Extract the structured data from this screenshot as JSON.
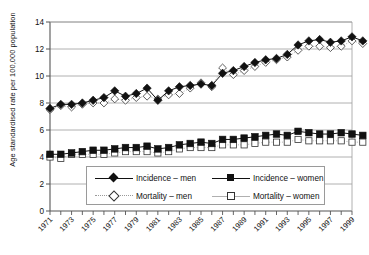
{
  "chart_data": {
    "type": "line",
    "title": "",
    "xlabel": "",
    "ylabel": "Age standardised rate per 100,000 population",
    "ylim": [
      0,
      14
    ],
    "ytick_values": [
      0,
      2,
      4,
      6,
      8,
      10,
      12,
      14
    ],
    "ytick_labels": [
      "0",
      "2",
      "4",
      "6",
      "8",
      "10",
      "12",
      "14"
    ],
    "grid": "horizontal",
    "legend_position": "bottom-center-inside",
    "x": [
      1971,
      1972,
      1973,
      1974,
      1975,
      1976,
      1977,
      1978,
      1979,
      1980,
      1981,
      1982,
      1983,
      1984,
      1985,
      1986,
      1987,
      1988,
      1989,
      1990,
      1991,
      1992,
      1993,
      1994,
      1995,
      1996,
      1997,
      1998,
      1999,
      2000
    ],
    "xtick_labels": [
      "1971",
      "1973",
      "1975",
      "1977",
      "1979",
      "1981",
      "1983",
      "1985",
      "1987",
      "1989",
      "1991",
      "1993",
      "1995",
      "1997",
      "1999"
    ],
    "xtick_label_years": [
      1971,
      1973,
      1975,
      1977,
      1979,
      1981,
      1983,
      1985,
      1987,
      1989,
      1991,
      1993,
      1995,
      1997,
      1999
    ],
    "series": [
      {
        "name": "Incidence – men",
        "marker": "filled-diamond",
        "line": "solid-black",
        "values": [
          7.6,
          7.9,
          7.9,
          8.0,
          8.2,
          8.4,
          8.9,
          8.5,
          8.7,
          9.1,
          8.2,
          8.9,
          9.2,
          9.3,
          9.4,
          9.3,
          10.2,
          10.4,
          10.7,
          11.0,
          11.2,
          11.3,
          11.6,
          12.3,
          12.6,
          12.7,
          12.5,
          12.6,
          12.9,
          12.6
        ]
      },
      {
        "name": "Mortality – men",
        "marker": "open-diamond",
        "line": "dotted-grey",
        "values": [
          7.5,
          7.8,
          7.7,
          7.9,
          8.0,
          8.0,
          8.3,
          8.2,
          8.4,
          8.5,
          8.3,
          8.6,
          8.7,
          9.1,
          9.5,
          9.2,
          10.6,
          10.1,
          10.4,
          10.7,
          11.0,
          11.2,
          11.4,
          11.9,
          12.2,
          12.2,
          12.1,
          12.2,
          12.6,
          12.4
        ]
      },
      {
        "name": "Incidence – women",
        "marker": "filled-square",
        "line": "solid-black",
        "values": [
          4.2,
          4.2,
          4.3,
          4.4,
          4.5,
          4.5,
          4.6,
          4.7,
          4.7,
          4.8,
          4.6,
          4.7,
          4.9,
          5.0,
          5.1,
          5.0,
          5.3,
          5.3,
          5.4,
          5.5,
          5.6,
          5.7,
          5.6,
          5.9,
          5.8,
          5.7,
          5.7,
          5.8,
          5.7,
          5.6
        ]
      },
      {
        "name": "Mortality – women",
        "marker": "open-square",
        "line": "dotted-grey",
        "values": [
          4.0,
          3.9,
          4.2,
          4.2,
          4.2,
          4.2,
          4.3,
          4.4,
          4.4,
          4.4,
          4.3,
          4.4,
          4.6,
          4.7,
          4.7,
          4.7,
          4.9,
          4.9,
          4.9,
          5.0,
          5.1,
          5.1,
          5.1,
          5.3,
          5.2,
          5.2,
          5.2,
          5.2,
          5.1,
          5.1
        ]
      }
    ]
  },
  "legend": {
    "items": [
      {
        "label": "Incidence – men"
      },
      {
        "label": "Incidence – women"
      },
      {
        "label": "Mortality – men"
      },
      {
        "label": "Mortality – women"
      }
    ]
  }
}
